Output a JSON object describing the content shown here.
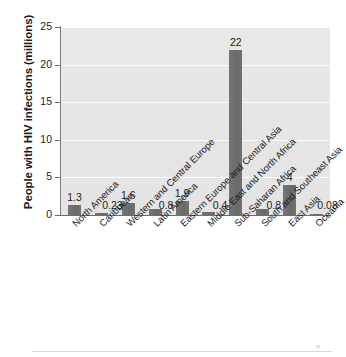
{
  "chart_data": {
    "type": "bar",
    "title": "",
    "xlabel": "",
    "ylabel": "People with HIV infections (millions)",
    "ylim": [
      0,
      25
    ],
    "yticks": [
      0,
      5,
      10,
      15,
      20,
      25
    ],
    "ytick_labels": [
      "0",
      "5",
      "10",
      "15",
      "20",
      "25"
    ],
    "grid": true,
    "legend": null,
    "bar_color": "#6e6e6e",
    "plot_background": "#e6e6e6",
    "categories": [
      "North America",
      "Caribbean",
      "Western and Central Europe",
      "Latin America",
      "Eastern Europe and Central Asia",
      "Middle East and North Africa",
      "Sub-Saharan Africa",
      "South and Southeast Asia",
      "East Asia",
      "Oceania"
    ],
    "values": [
      1.3,
      0.23,
      1.6,
      0.8,
      1.9,
      0.4,
      22,
      0.8,
      4,
      0.08
    ],
    "value_labels": [
      "1.3",
      "0.23",
      "1.6",
      "0.8",
      "1.9",
      "0.4",
      "22",
      "0.8",
      "4",
      "0.08"
    ]
  }
}
